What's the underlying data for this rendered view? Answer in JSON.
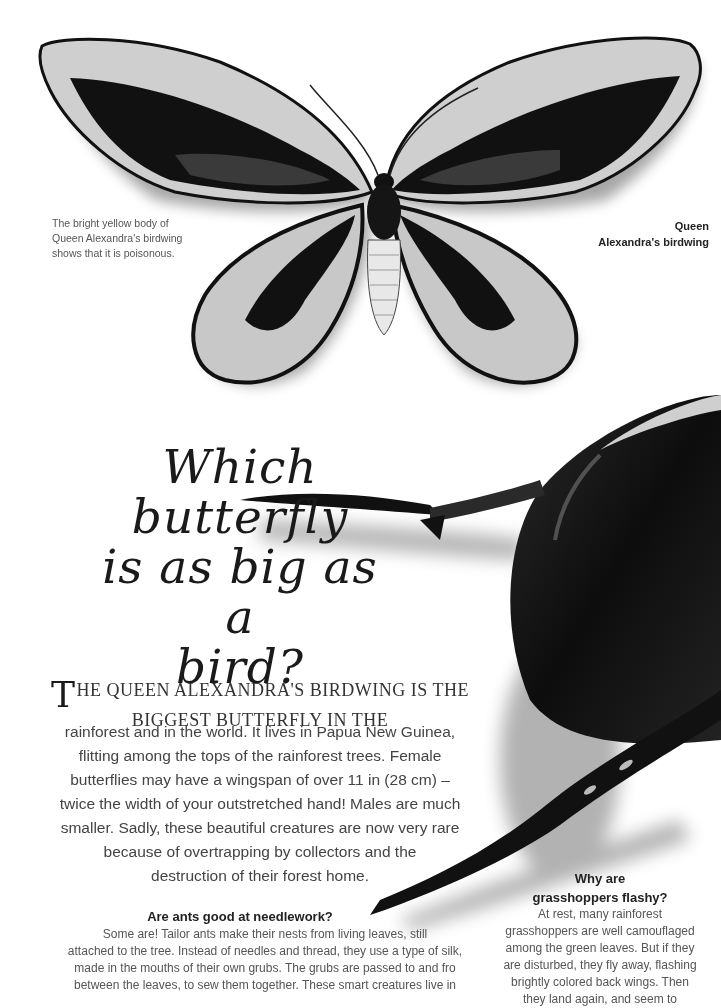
{
  "illustrations": {
    "butterfly": "queen-alexandras-birdwing-illustration",
    "beetle": "beetle-illustration"
  },
  "captions": {
    "left": "The bright yellow body of Queen Alexandra's birdwing shows that it is poisonous.",
    "right_line1": "Queen",
    "right_line2": "Alexandra's birdwing"
  },
  "title": {
    "line1": "Which",
    "line2": "butterfly",
    "line3": "is as big as a",
    "line4": "bird?"
  },
  "lead": {
    "dropcap": "T",
    "line1": "HE QUEEN ALEXANDRA'S BIRDWING IS THE",
    "line2": "BIGGEST BUTTERFLY IN THE"
  },
  "body": {
    "lines": [
      "rainforest and in the world. It lives in Papua New Guinea,",
      "flitting among the tops of the rainforest trees. Female",
      "butterflies may have a wingspan of over 11 in (28 cm) –",
      "twice the width of your outstretched hand! Males are much",
      "smaller. Sadly, these beautiful creatures are now very rare",
      "because of overtrapping by collectors and the",
      "destruction of their forest home."
    ]
  },
  "sidebar_ants": {
    "heading": "Are ants good at needlework?",
    "lines": [
      "Some are! Tailor ants make their nests from living leaves, still",
      "attached to the tree. Instead of needles and thread, they use a type of silk,",
      "made in the mouths of their own grubs. The grubs are passed to and fro",
      "between the leaves, to sew them together. These smart creatures live in"
    ]
  },
  "sidebar_grasshoppers": {
    "heading_line1": "Why are",
    "heading_line2": "grasshoppers flashy?",
    "lines": [
      "At rest, many rainforest",
      "grasshoppers are well camouflaged",
      "among the green leaves. But if they",
      "are disturbed, they fly away, flashing",
      "brightly colored back wings. Then",
      "they land again, and seem to"
    ]
  }
}
